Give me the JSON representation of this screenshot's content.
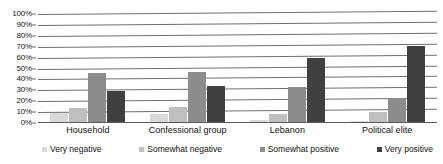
{
  "chart_data": {
    "type": "bar",
    "title": "",
    "xlabel": "",
    "ylabel": "",
    "ylim": [
      0,
      100
    ],
    "ytick_labels": [
      "100%",
      "90%",
      "80%",
      "70%",
      "60%",
      "50%",
      "40%",
      "30%",
      "20%",
      "10%",
      "0%"
    ],
    "ytick_values": [
      100,
      90,
      80,
      70,
      60,
      50,
      40,
      30,
      20,
      10,
      0
    ],
    "grid": true,
    "legend_position": "bottom",
    "categories": [
      "Household",
      "Confessional group",
      "Lebanon",
      "Political elite"
    ],
    "series": [
      {
        "name": "Very negative",
        "color": "#d9d9d9",
        "values": [
          9,
          8,
          3,
          2
        ]
      },
      {
        "name": "Somewhat negative",
        "color": "#bfbfbf",
        "values": [
          14,
          15,
          8,
          10
        ]
      },
      {
        "name": "Somewhat positive",
        "color": "#8c8c8c",
        "values": [
          46,
          47,
          33,
          23
        ]
      },
      {
        "name": "Very positive",
        "color": "#404040",
        "values": [
          29,
          34,
          60,
          71
        ]
      }
    ]
  }
}
